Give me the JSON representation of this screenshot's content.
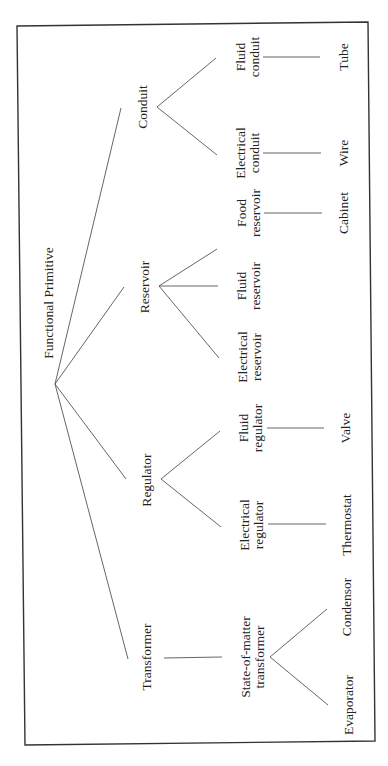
{
  "diagram": {
    "type": "tree",
    "orientation": "rotated-90-ccw",
    "root": {
      "label": "Functional Primitive"
    },
    "level1": [
      {
        "label": "Conduit"
      },
      {
        "label": "Reservoir"
      },
      {
        "label": "Regulator"
      },
      {
        "label": "Transformer"
      }
    ],
    "level2": {
      "conduit": [
        {
          "line1": "Fluid",
          "line2": "conduit"
        },
        {
          "line1": "Electrical",
          "line2": "conduit"
        }
      ],
      "reservoir": [
        {
          "line1": "Food",
          "line2": "reservoir"
        },
        {
          "line1": "Fluid",
          "line2": "reservoir"
        },
        {
          "line1": "Electrical",
          "line2": "reservoir"
        }
      ],
      "regulator": [
        {
          "line1": "Fluid",
          "line2": "regulator"
        },
        {
          "line1": "Electrical",
          "line2": "regulator"
        }
      ],
      "transformer": [
        {
          "line1": "State-of-matter",
          "line2": "transformer"
        }
      ]
    },
    "level3": {
      "fluid_conduit": "Tube",
      "electrical_conduit": "Wire",
      "food_reservoir": "Cabinet",
      "fluid_regulator": "Valve",
      "electrical_regulator": "Thermostat",
      "state_of_matter_1": "Condensor",
      "state_of_matter_2": "Evaporator"
    }
  }
}
